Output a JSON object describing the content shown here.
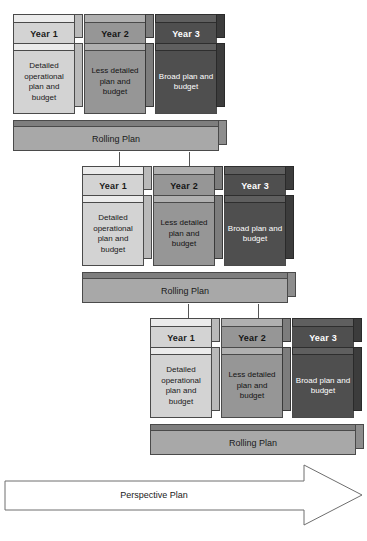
{
  "diagram": {
    "columns": [
      {
        "header": "Year 1",
        "body": "Detailed operational plan and budget",
        "shade": "light"
      },
      {
        "header": "Year 2",
        "body": "Less detailed plan and budget",
        "shade": "mid"
      },
      {
        "header": "Year 3",
        "body": "Broad plan and budget",
        "shade": "dark"
      }
    ],
    "base_label": "Rolling Plan",
    "groups": [
      {
        "index": 1,
        "base_label": "Rolling Plan"
      },
      {
        "index": 2,
        "base_label": "Rolling Plan"
      },
      {
        "index": 3,
        "base_label": "Rolling Plan"
      }
    ],
    "perspective_label": "Perspective Plan",
    "colors": {
      "light": "#d3d3d3",
      "mid": "#969696",
      "dark": "#4f4f4f",
      "base": "#a8a8a8",
      "outline": "#4a4a4a",
      "arrow": "#555555",
      "page_background": "#ffffff"
    }
  }
}
